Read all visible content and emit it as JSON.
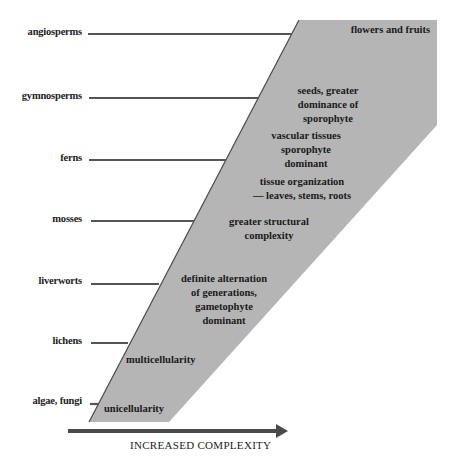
{
  "diagram": {
    "title": "",
    "colors": {
      "wedge_fill": "#b5b5b5",
      "line": "#555555",
      "text": "#222222"
    },
    "groups": [
      {
        "label": "angiosperms",
        "y": 34
      },
      {
        "label": "gymnosperms",
        "y": 98
      },
      {
        "label": "ferns",
        "y": 160
      },
      {
        "label": "mosses",
        "y": 221
      },
      {
        "label": "liverworts",
        "y": 284
      },
      {
        "label": "lichens",
        "y": 343
      },
      {
        "label": "algae, fungi",
        "y": 404
      }
    ],
    "features": [
      {
        "lines": [
          "flowers and fruits"
        ]
      },
      {
        "lines": [
          "seeds, greater",
          "dominance of",
          "sporophyte"
        ]
      },
      {
        "lines": [
          "vascular tissues",
          "sporophyte",
          "dominant"
        ]
      },
      {
        "lines": [
          "tissue organization",
          "— leaves, stems, roots"
        ]
      },
      {
        "lines": [
          "greater structural",
          "complexity"
        ]
      },
      {
        "lines": [
          "definite alternation",
          "of generations,",
          "gametophyte",
          "dominant"
        ]
      },
      {
        "lines": [
          "multicellularity"
        ]
      },
      {
        "lines": [
          "unicellularity"
        ]
      }
    ],
    "axis": {
      "label": "INCREASED  COMPLEXITY",
      "direction": "right"
    }
  }
}
